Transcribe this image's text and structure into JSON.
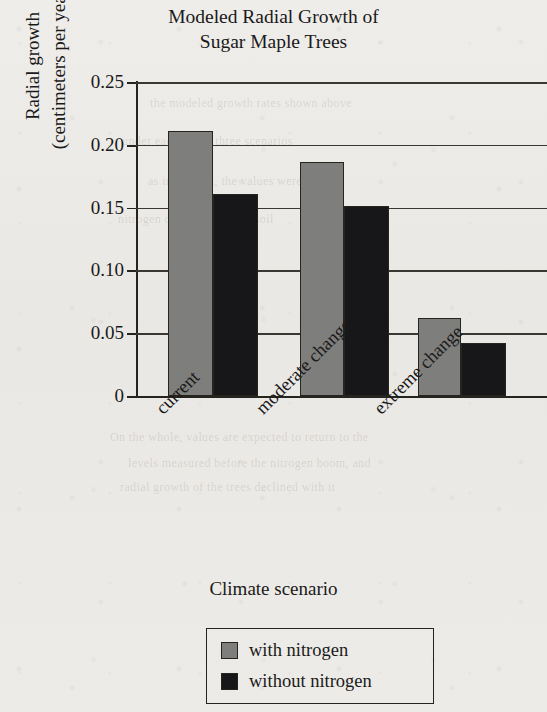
{
  "chart_data": {
    "type": "bar",
    "title": "Modeled Radial Growth of Sugar Maple Trees",
    "title_lines": [
      "Modeled Radial Growth of",
      "Sugar Maple Trees"
    ],
    "xlabel": "Climate scenario",
    "ylabel": "Radial growth (centimeters per year)",
    "ylabel_lines": [
      "Radial growth",
      "(centimeters per year)"
    ],
    "categories": [
      "current",
      "moderate change",
      "extreme change"
    ],
    "series": [
      {
        "name": "with nitrogen",
        "color": "#7e7e7c",
        "values": [
          0.211,
          0.186,
          0.062
        ]
      },
      {
        "name": "without nitrogen",
        "color": "#17171a",
        "values": [
          0.161,
          0.151,
          0.042
        ]
      }
    ],
    "ylim": [
      0,
      0.25
    ],
    "yticks": [
      "0",
      "0.05",
      "0.10",
      "0.15",
      "0.20",
      "0.25"
    ],
    "ytick_values": [
      0,
      0.05,
      0.1,
      0.15,
      0.2,
      0.25
    ],
    "grid": "horizontal",
    "legend_position": "bottom-center"
  },
  "legend": {
    "entries": [
      {
        "label": "with nitrogen",
        "color": "#7e7e7c"
      },
      {
        "label": "without nitrogen",
        "color": "#17171a"
      }
    ]
  },
  "background_bleed": [
    {
      "text": "the modeled growth rates shown above",
      "x": 150,
      "y": 96
    },
    {
      "text": "under each of the three scenarios",
      "x": 122,
      "y": 134
    },
    {
      "text": "as in the text, the values were",
      "x": 148,
      "y": 174
    },
    {
      "text": "nitrogen deposition in the soil",
      "x": 118,
      "y": 212
    },
    {
      "text": "On the whole, values are expected to return to the",
      "x": 110,
      "y": 430
    },
    {
      "text": "levels measured before the nitrogen boom, and",
      "x": 128,
      "y": 456
    },
    {
      "text": "radial growth of the trees declined with it",
      "x": 120,
      "y": 480
    }
  ]
}
